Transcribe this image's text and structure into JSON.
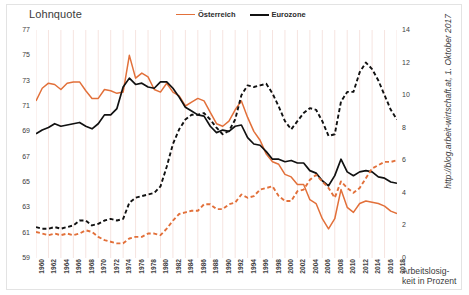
{
  "chart_title": "Lohnquote",
  "source_note": "http://blog.arbeit-wirtschaft.at, 1. Oktober 2017",
  "y2_caption_line1": "Arbeitslosig-",
  "y2_caption_line2": "keit in Prozent",
  "legend": {
    "items": [
      {
        "label": "Österreich",
        "color": "#e2703a",
        "style": "solid"
      },
      {
        "label": "Eurozone",
        "color": "#111111",
        "style": "solid"
      }
    ]
  },
  "colors": {
    "austria": "#e2703a",
    "eurozone": "#111111",
    "gridline": "#f6e4e0",
    "frame": "#e3e3e3",
    "text": "#3d3d3d"
  },
  "chart_data": {
    "type": "line",
    "title": "Lohnquote",
    "xlabel": "",
    "ylabel": "Lohnquote",
    "y2label": "Arbeitslosigkeit in Prozent",
    "grid": true,
    "legend_position": "top-center",
    "ylim": [
      59,
      77
    ],
    "y2lim": [
      0,
      14
    ],
    "yticks": [
      77,
      75,
      73,
      71,
      69,
      67,
      65,
      63,
      61,
      59
    ],
    "y2ticks": [
      14,
      12,
      10,
      8,
      6,
      4,
      2,
      0
    ],
    "x": [
      1960,
      1961,
      1962,
      1963,
      1964,
      1965,
      1966,
      1967,
      1968,
      1969,
      1970,
      1971,
      1972,
      1973,
      1974,
      1975,
      1976,
      1977,
      1978,
      1979,
      1980,
      1981,
      1982,
      1983,
      1984,
      1985,
      1986,
      1987,
      1988,
      1989,
      1990,
      1991,
      1992,
      1993,
      1994,
      1995,
      1996,
      1997,
      1998,
      1999,
      2000,
      2001,
      2002,
      2003,
      2004,
      2005,
      2006,
      2007,
      2008,
      2009,
      2010,
      2011,
      2012,
      2013,
      2014,
      2015,
      2016,
      2017,
      2018
    ],
    "xticks": [
      1960,
      1962,
      1964,
      1966,
      1968,
      1970,
      1972,
      1974,
      1976,
      1978,
      1980,
      1982,
      1984,
      1986,
      1988,
      1990,
      1992,
      1994,
      1996,
      1998,
      2000,
      2002,
      2004,
      2006,
      2008,
      2010,
      2012,
      2014,
      2016,
      2018
    ],
    "series": [
      {
        "name": "Österreich",
        "axis": "left",
        "style": "solid",
        "color": "#e2703a",
        "unit": "Lohnquote",
        "values": [
          71.4,
          72.4,
          72.8,
          72.7,
          72.3,
          72.8,
          72.9,
          72.9,
          72.2,
          71.6,
          71.6,
          72.3,
          72.2,
          72.0,
          72.1,
          75.0,
          73.2,
          73.6,
          73.3,
          72.3,
          72.1,
          72.8,
          72.1,
          71.8,
          71.0,
          71.3,
          71.6,
          71.4,
          70.5,
          69.6,
          69.4,
          69.8,
          70.7,
          71.4,
          70.1,
          69.0,
          68.3,
          67.2,
          66.6,
          66.4,
          65.6,
          65.4,
          64.8,
          64.8,
          63.6,
          63.3,
          62.1,
          61.3,
          62.1,
          64.4,
          63.0,
          62.6,
          63.3,
          63.5,
          63.4,
          63.3,
          63.1,
          62.7,
          62.5
        ]
      },
      {
        "name": "Eurozone",
        "axis": "left",
        "style": "solid",
        "color": "#111111",
        "unit": "Lohnquote",
        "values": [
          68.8,
          69.1,
          69.3,
          69.6,
          69.4,
          69.5,
          69.6,
          69.7,
          69.4,
          69.2,
          69.6,
          70.3,
          70.3,
          70.8,
          72.5,
          73.2,
          72.7,
          72.8,
          72.5,
          72.4,
          72.9,
          72.9,
          72.4,
          71.7,
          70.9,
          70.6,
          70.3,
          70.2,
          69.4,
          68.9,
          69.1,
          69.0,
          69.4,
          69.5,
          68.5,
          68.0,
          67.9,
          67.4,
          66.8,
          66.8,
          66.6,
          66.7,
          66.5,
          66.5,
          65.9,
          65.7,
          65.1,
          64.7,
          65.5,
          66.8,
          65.8,
          65.5,
          65.8,
          65.9,
          65.8,
          65.4,
          65.3,
          65.0,
          64.9
        ]
      },
      {
        "name": "Österreich (Arbeitslosigkeit)",
        "axis": "right",
        "style": "dashed",
        "color": "#e2703a",
        "unit": "Prozent",
        "values": [
          1.6,
          1.5,
          1.4,
          1.5,
          1.4,
          1.5,
          1.4,
          1.5,
          1.7,
          1.6,
          1.3,
          1.1,
          1.0,
          0.9,
          0.9,
          1.2,
          1.3,
          1.3,
          1.5,
          1.5,
          1.4,
          1.8,
          2.3,
          2.7,
          2.8,
          2.9,
          2.9,
          3.3,
          3.3,
          3.0,
          3.0,
          3.3,
          3.4,
          3.9,
          3.7,
          3.8,
          4.2,
          4.3,
          4.4,
          3.8,
          3.5,
          3.5,
          4.1,
          4.2,
          4.8,
          5.1,
          4.7,
          4.3,
          3.7,
          4.7,
          4.3,
          4.0,
          4.3,
          4.9,
          5.5,
          5.7,
          5.9,
          5.9,
          6.0
        ]
      },
      {
        "name": "Eurozone (Arbeitslosigkeit)",
        "axis": "right",
        "style": "dashed",
        "color": "#111111",
        "unit": "Prozent",
        "values": [
          1.9,
          1.8,
          1.8,
          1.9,
          1.8,
          1.9,
          2.0,
          2.3,
          2.3,
          2.0,
          2.1,
          2.3,
          2.4,
          2.3,
          2.4,
          3.4,
          3.7,
          3.8,
          3.9,
          4.0,
          4.4,
          5.6,
          7.0,
          7.9,
          8.5,
          8.8,
          8.8,
          8.9,
          8.5,
          8.0,
          7.6,
          7.8,
          8.5,
          10.0,
          10.6,
          10.5,
          10.6,
          10.7,
          10.1,
          9.3,
          8.4,
          7.9,
          8.4,
          8.9,
          9.2,
          9.1,
          8.4,
          7.5,
          7.6,
          9.6,
          10.2,
          10.2,
          11.4,
          12.0,
          11.6,
          10.9,
          10.0,
          9.1,
          8.5
        ]
      }
    ]
  }
}
